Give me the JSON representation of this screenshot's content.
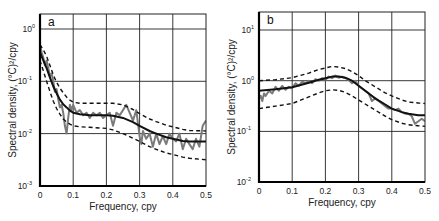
{
  "chart_data": [
    {
      "type": "line",
      "panel": "a",
      "title": "",
      "xlabel": "Frequency, cpy",
      "ylabel": "Spectral density, (°C)²/cpy",
      "xlim": [
        0,
        0.5
      ],
      "ylim": [
        0.001,
        2.1
      ],
      "yscale": "log",
      "x_ticks": [
        "0",
        "0.1",
        "0.2",
        "0.3",
        "0.4",
        "0.5"
      ],
      "y_ticks": [
        {
          "base": "10",
          "exp": "0",
          "value": 1
        },
        {
          "base": "10",
          "exp": "-1",
          "value": 0.1
        },
        {
          "base": "10",
          "exp": "-2",
          "value": 0.01
        },
        {
          "base": "10",
          "exp": "-3",
          "value": 0.001
        }
      ],
      "grid": true,
      "series": [
        {
          "name": "observed",
          "style": "gray-solid",
          "x": [
            0.0,
            0.005,
            0.01,
            0.015,
            0.02,
            0.025,
            0.03,
            0.035,
            0.04,
            0.045,
            0.05,
            0.055,
            0.06,
            0.065,
            0.07,
            0.075,
            0.08,
            0.085,
            0.09,
            0.095,
            0.1,
            0.11,
            0.12,
            0.13,
            0.14,
            0.15,
            0.16,
            0.17,
            0.18,
            0.19,
            0.2,
            0.21,
            0.22,
            0.23,
            0.24,
            0.25,
            0.26,
            0.27,
            0.28,
            0.29,
            0.3,
            0.305,
            0.31,
            0.32,
            0.33,
            0.34,
            0.35,
            0.36,
            0.37,
            0.38,
            0.39,
            0.4,
            0.41,
            0.42,
            0.43,
            0.44,
            0.45,
            0.46,
            0.47,
            0.48,
            0.49,
            0.5
          ],
          "log10_y": [
            -0.3,
            -0.45,
            -0.55,
            -0.7,
            -0.6,
            -0.75,
            -0.9,
            -0.85,
            -1.0,
            -1.2,
            -1.15,
            -1.35,
            -1.5,
            -1.45,
            -1.6,
            -1.85,
            -2.0,
            -1.7,
            -1.45,
            -1.55,
            -1.45,
            -1.6,
            -1.55,
            -1.65,
            -1.6,
            -1.7,
            -1.6,
            -1.65,
            -1.6,
            -1.7,
            -1.65,
            -1.6,
            -1.85,
            -1.6,
            -1.65,
            -1.55,
            -1.45,
            -1.6,
            -1.75,
            -1.55,
            -2.05,
            -2.2,
            -1.95,
            -2.1,
            -2.0,
            -2.25,
            -2.0,
            -2.2,
            -2.05,
            -2.2,
            -2.0,
            -2.1,
            -2.15,
            -2.0,
            -2.3,
            -2.1,
            -2.2,
            -2.3,
            -2.1,
            -2.25,
            -1.85,
            -1.75
          ]
        },
        {
          "name": "fitted",
          "style": "black-solid",
          "x": [
            0.0,
            0.01,
            0.02,
            0.03,
            0.04,
            0.05,
            0.06,
            0.07,
            0.08,
            0.09,
            0.1,
            0.12,
            0.15,
            0.2,
            0.22,
            0.25,
            0.28,
            0.3,
            0.33,
            0.35,
            0.38,
            0.4,
            0.43,
            0.45,
            0.5
          ],
          "log10_y": [
            -0.45,
            -0.6,
            -0.75,
            -0.93,
            -1.1,
            -1.23,
            -1.35,
            -1.44,
            -1.5,
            -1.56,
            -1.6,
            -1.63,
            -1.65,
            -1.65,
            -1.66,
            -1.7,
            -1.78,
            -1.85,
            -1.95,
            -2.0,
            -2.07,
            -2.1,
            -2.14,
            -2.15,
            -2.15
          ]
        },
        {
          "name": "upper_bound",
          "style": "black-dashed",
          "x": [
            0.0,
            0.01,
            0.02,
            0.03,
            0.04,
            0.05,
            0.06,
            0.07,
            0.08,
            0.09,
            0.1,
            0.12,
            0.15,
            0.2,
            0.22,
            0.25,
            0.28,
            0.3,
            0.33,
            0.35,
            0.38,
            0.4,
            0.43,
            0.45,
            0.5
          ],
          "log10_y": [
            -0.3,
            -0.4,
            -0.52,
            -0.7,
            -0.88,
            -1.02,
            -1.13,
            -1.22,
            -1.3,
            -1.36,
            -1.4,
            -1.42,
            -1.42,
            -1.42,
            -1.42,
            -1.45,
            -1.54,
            -1.62,
            -1.72,
            -1.77,
            -1.84,
            -1.87,
            -1.92,
            -1.94,
            -1.95
          ]
        },
        {
          "name": "lower_bound",
          "style": "black-dashed",
          "x": [
            0.0,
            0.01,
            0.02,
            0.03,
            0.04,
            0.05,
            0.06,
            0.07,
            0.08,
            0.09,
            0.1,
            0.12,
            0.15,
            0.2,
            0.22,
            0.25,
            0.28,
            0.3,
            0.33,
            0.35,
            0.38,
            0.4,
            0.43,
            0.45,
            0.5
          ],
          "log10_y": [
            -0.6,
            -0.8,
            -1.0,
            -1.2,
            -1.38,
            -1.52,
            -1.63,
            -1.72,
            -1.78,
            -1.82,
            -1.85,
            -1.87,
            -1.88,
            -1.9,
            -1.93,
            -2.0,
            -2.09,
            -2.15,
            -2.25,
            -2.3,
            -2.37,
            -2.4,
            -2.45,
            -2.47,
            -2.5
          ]
        }
      ]
    },
    {
      "type": "line",
      "panel": "b",
      "title": "",
      "xlabel": "Frequency, cpy",
      "ylabel": "Spectral density, (°C)²/cpy",
      "xlim": [
        0,
        0.5
      ],
      "ylim": [
        0.01,
        20
      ],
      "yscale": "log",
      "x_ticks": [
        "0",
        "0.1",
        "0.2",
        "0.3",
        "0.4",
        "0.5"
      ],
      "y_ticks": [
        {
          "base": "10",
          "exp": "1",
          "value": 10
        },
        {
          "base": "10",
          "exp": "0",
          "value": 1
        },
        {
          "base": "10",
          "exp": "-1",
          "value": 0.1
        },
        {
          "base": "10",
          "exp": "-2",
          "value": 0.01
        }
      ],
      "grid": true,
      "series": [
        {
          "name": "observed",
          "style": "gray-solid",
          "x": [
            0.0,
            0.005,
            0.01,
            0.015,
            0.02,
            0.03,
            0.04,
            0.05,
            0.06,
            0.07,
            0.08,
            0.09,
            0.1,
            0.11,
            0.12,
            0.13,
            0.14,
            0.15,
            0.16,
            0.17,
            0.18,
            0.19,
            0.2,
            0.21,
            0.22,
            0.23,
            0.24,
            0.25,
            0.26,
            0.27,
            0.28,
            0.29,
            0.3,
            0.31,
            0.32,
            0.33,
            0.34,
            0.35,
            0.36,
            0.37,
            0.38,
            0.39,
            0.4,
            0.41,
            0.42,
            0.43,
            0.44,
            0.45,
            0.46,
            0.47,
            0.48,
            0.49,
            0.5
          ],
          "log10_y": [
            -0.35,
            -0.3,
            -0.4,
            -0.25,
            -0.3,
            -0.2,
            -0.25,
            -0.12,
            -0.2,
            -0.1,
            -0.18,
            -0.12,
            -0.15,
            -0.05,
            -0.1,
            -0.02,
            -0.05,
            0.0,
            -0.05,
            0.03,
            0.0,
            0.05,
            0.02,
            0.08,
            0.05,
            0.1,
            0.06,
            0.08,
            0.05,
            0.02,
            -0.05,
            0.0,
            -0.1,
            -0.15,
            -0.2,
            -0.25,
            -0.4,
            -0.35,
            -0.4,
            -0.45,
            -0.5,
            -0.55,
            -0.55,
            -0.58,
            -0.55,
            -0.62,
            -0.65,
            -0.65,
            -0.7,
            -0.85,
            -0.8,
            -0.75,
            -0.8
          ]
        },
        {
          "name": "fitted",
          "style": "black-solid",
          "x": [
            0.0,
            0.05,
            0.1,
            0.15,
            0.18,
            0.2,
            0.22,
            0.24,
            0.26,
            0.28,
            0.3,
            0.32,
            0.35,
            0.38,
            0.4,
            0.43,
            0.45,
            0.48,
            0.5
          ],
          "log10_y": [
            -0.2,
            -0.17,
            -0.13,
            -0.04,
            0.02,
            0.05,
            0.08,
            0.08,
            0.06,
            0.0,
            -0.1,
            -0.2,
            -0.35,
            -0.47,
            -0.55,
            -0.62,
            -0.65,
            -0.68,
            -0.68
          ]
        },
        {
          "name": "upper_bound",
          "style": "black-dashed",
          "x": [
            0.0,
            0.05,
            0.1,
            0.15,
            0.18,
            0.2,
            0.22,
            0.24,
            0.26,
            0.28,
            0.3,
            0.32,
            0.35,
            0.38,
            0.4,
            0.43,
            0.45,
            0.48,
            0.5
          ],
          "log10_y": [
            0.0,
            0.02,
            0.06,
            0.15,
            0.22,
            0.25,
            0.28,
            0.27,
            0.24,
            0.18,
            0.1,
            0.0,
            -0.12,
            -0.24,
            -0.3,
            -0.38,
            -0.42,
            -0.44,
            -0.45
          ]
        },
        {
          "name": "lower_bound",
          "style": "black-dashed",
          "x": [
            0.0,
            0.05,
            0.1,
            0.15,
            0.18,
            0.2,
            0.22,
            0.24,
            0.26,
            0.28,
            0.3,
            0.32,
            0.35,
            0.38,
            0.4,
            0.43,
            0.45,
            0.48,
            0.5
          ],
          "log10_y": [
            -0.55,
            -0.5,
            -0.45,
            -0.32,
            -0.24,
            -0.2,
            -0.18,
            -0.19,
            -0.23,
            -0.3,
            -0.38,
            -0.46,
            -0.58,
            -0.7,
            -0.77,
            -0.84,
            -0.87,
            -0.89,
            -0.9
          ]
        }
      ]
    }
  ],
  "panels": [
    {
      "label": "a",
      "ylabel": "Spectral density, (°C)²/cpy",
      "xlabel": "Frequency, cpy"
    },
    {
      "label": "b",
      "ylabel": "Spectral density, (°C)²/cpy",
      "xlabel": "Frequency, cpy"
    }
  ],
  "colors": {
    "observed": "#7a7a7a",
    "fitted": "#111111",
    "bounds": "#111111",
    "grid": "#222222",
    "axis": "#000000"
  }
}
